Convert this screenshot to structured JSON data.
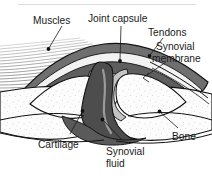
{
  "figure": {
    "background_color": "#ffffff"
  },
  "labels": {
    "muscles": "Muscles",
    "joint_capsule": "Joint capsule",
    "tendons": "Tendons",
    "synovial_membrane_l1": "Synovial",
    "synovial_membrane_l2": "membrane",
    "cartilage": "Cartilage",
    "synovial_fluid_l1": "Synovial",
    "synovial_fluid_l2": "fluid",
    "bone": "Bone"
  },
  "colors": {
    "outline": "#111111",
    "capsule_dark": "#5f5f5f",
    "capsule_mid": "#7d7d7d",
    "cartilage_light": "#c9c9c9",
    "bone_fill": "#fbfbfb",
    "muscle_line": "#a8a8a8",
    "tendon_gray": "#8a8a8a",
    "text": "#1a1a1a",
    "top_rule": "#d8d8d8"
  },
  "structures": [
    {
      "name": "muscles",
      "description": "striated parallel fiber lines, upper left"
    },
    {
      "name": "tendons",
      "description": "gray band converging from upper right"
    },
    {
      "name": "joint-capsule",
      "description": "dark gray enclosure around joint cavity"
    },
    {
      "name": "synovial-membrane",
      "description": "thin inner lining of capsule"
    },
    {
      "name": "synovial-fluid",
      "description": "dark cavity between bone ends"
    },
    {
      "name": "cartilage",
      "description": "light gray caps on bone ends"
    },
    {
      "name": "bone",
      "description": "stippled light bodies left and right"
    }
  ]
}
